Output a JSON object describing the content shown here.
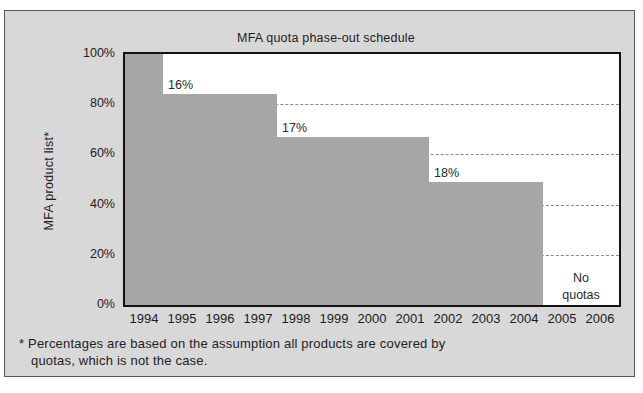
{
  "title": "MFA quota phase-out schedule",
  "y_axis_label": "MFA product list*",
  "footnote": {
    "line1": "* Percentages are based on the assumption all products are covered by",
    "line2": "quotas, which is not the case."
  },
  "no_quotas_lines": [
    "No",
    "quotas"
  ],
  "chart_data": {
    "type": "area",
    "subtype": "step-post",
    "title": "MFA quota phase-out schedule",
    "ylabel": "MFA product list*",
    "xlabel": "",
    "ylim": [
      0,
      100
    ],
    "x_categories": [
      "1994",
      "1995",
      "1996",
      "1997",
      "1998",
      "1999",
      "2000",
      "2001",
      "2002",
      "2003",
      "2004",
      "2005",
      "2006"
    ],
    "y_tick_labels": [
      "100%",
      "80%",
      "60%",
      "40%",
      "20%",
      "0%"
    ],
    "y_tick_values": [
      100,
      80,
      60,
      40,
      20,
      0
    ],
    "gridline_values": [
      80,
      60,
      40,
      20
    ],
    "grid_style": "dashed",
    "legend": "none",
    "segments": [
      {
        "start_year": 1994,
        "end_year": 1995,
        "value_pct": 100,
        "label": ""
      },
      {
        "start_year": 1995,
        "end_year": 1998,
        "value_pct": 84,
        "label": "16%"
      },
      {
        "start_year": 1998,
        "end_year": 2002,
        "value_pct": 67,
        "label": "17%"
      },
      {
        "start_year": 2002,
        "end_year": 2005,
        "value_pct": 49,
        "label": "18%"
      },
      {
        "start_year": 2005,
        "end_year": 2007,
        "value_pct": 0,
        "label": "No quotas"
      }
    ],
    "colors": {
      "fill": "#a6a6a6",
      "plot_bg": "#ffffff",
      "figure_bg": "#d8d8d8",
      "grid": "#8a8a8a",
      "text": "#1c1c1c"
    }
  }
}
